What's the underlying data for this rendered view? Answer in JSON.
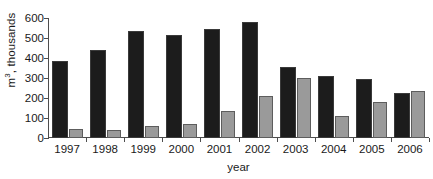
{
  "chart_data": {
    "type": "bar",
    "title": "",
    "subtitle": "",
    "xlabel": "year",
    "ylabel": "m³, thousands",
    "ylabel_parts": {
      "prefix": "m",
      "sup": "3",
      "suffix": ", thousands"
    },
    "categories": [
      "1997",
      "1998",
      "1999",
      "2000",
      "2001",
      "2002",
      "2003",
      "2004",
      "2005",
      "2006"
    ],
    "series": [
      {
        "name": "dark-series",
        "color": "#1c1c1c",
        "values": [
          385,
          440,
          535,
          515,
          545,
          580,
          355,
          310,
          295,
          225
        ]
      },
      {
        "name": "light-series",
        "color": "#9a9a9a",
        "values": [
          45,
          42,
          58,
          68,
          135,
          210,
          300,
          110,
          180,
          235
        ]
      }
    ],
    "ylim": [
      0,
      600
    ],
    "yticks": [
      0,
      100,
      200,
      300,
      400,
      500,
      600
    ],
    "ytick_labels": [
      "0",
      "100",
      "200",
      "300",
      "400",
      "500",
      "600"
    ],
    "grid": false,
    "legend": "none"
  },
  "colors": {
    "dark_bar": "#1c1c1c",
    "dark_bar_border": "#3a3a3a",
    "light_bar": "#9a9a9a",
    "light_bar_border": "#5d5d5d",
    "axis": "#4d4d4d",
    "text": "#1a1a1a",
    "background": "#ffffff"
  }
}
